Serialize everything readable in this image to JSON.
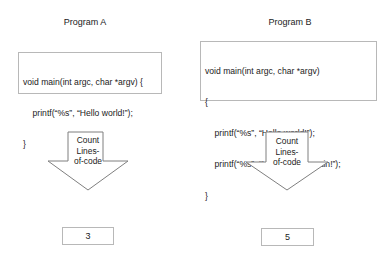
{
  "programs": [
    {
      "title": "Program A",
      "code_lines": [
        "void main(int argc, char *argv) {",
        "    printf(“%s”, “Hello world!”);",
        "}"
      ],
      "process_label": [
        "Count",
        "Lines-",
        "of-code"
      ],
      "result": "3"
    },
    {
      "title": "Program B",
      "code_lines": [
        "void main(int argc, char *argv)",
        "{",
        "    printf(“%s”, “Hello world!”);",
        "    printf(“%s”, “Hello world, again!”);",
        "}"
      ],
      "process_label": [
        "Count",
        "Lines-",
        "of-code"
      ],
      "result": "5"
    }
  ],
  "colors": {
    "border": "#b8b8b8",
    "arrow_stroke": "#7f7f7f",
    "text": "#222222"
  }
}
